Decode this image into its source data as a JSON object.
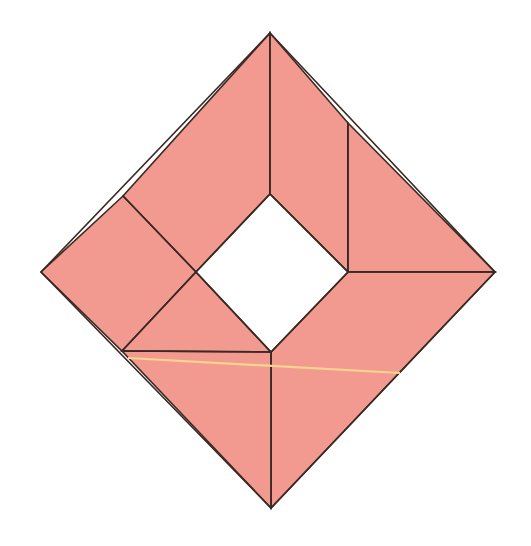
{
  "canvas": {
    "width": 531,
    "height": 546,
    "background_color": "#FFFFFF",
    "title": "Folded square diagram"
  },
  "style": {
    "fill_color": "#F29A90",
    "edge_color": "#3A2A24",
    "edge_width": 1.6,
    "crease_width": 1.4,
    "highlight_color": "#F8D58C",
    "highlight_width": 2.2,
    "hole_color": "#FFFFFF"
  },
  "geometry": {
    "outer_diamond": {
      "name": "outer-square-rotated-45",
      "vertices": {
        "top": [
          270,
          33
        ],
        "right": [
          495,
          272
        ],
        "bottom": [
          271,
          508
        ],
        "left": [
          41,
          272
        ]
      }
    },
    "inner_hole": {
      "name": "inner-white-square",
      "vertices": {
        "top": [
          270,
          194
        ],
        "right": [
          348,
          272
        ],
        "bottom": [
          271,
          352
        ],
        "left": [
          196,
          272
        ]
      }
    },
    "crease_points": {
      "upper_left_edge_branch": [
        123,
        196
      ],
      "upper_right_edge_branch": [
        348,
        123
      ],
      "lower_left_edge_branch": [
        122,
        351
      ],
      "highlight_start": [
        128,
        358
      ],
      "highlight_end": [
        400,
        373
      ]
    }
  },
  "shapes": [
    {
      "name": "face-top-left",
      "points": "270,33 270,194 196,272 123,196",
      "description": "Upper left flap of folded paper"
    },
    {
      "name": "face-left-outer",
      "points": "123,196 196,272 122,351 41,272",
      "description": "Left outer quadrant wedge"
    },
    {
      "name": "face-left-inner-triangle",
      "points": "196,272 271,352 122,351",
      "description": "Lower left inner triangle"
    },
    {
      "name": "face-top-right",
      "points": "270,33 348,123 348,272 270,194",
      "description": "Upper right flap of folded paper"
    },
    {
      "name": "face-right-outer",
      "points": "348,123 495,272 348,272",
      "description": "Right outer triangle"
    },
    {
      "name": "face-right-lower",
      "points": "348,272 495,272 271,508 271,352",
      "description": "Lower right large quadrilateral"
    },
    {
      "name": "face-bottom-left",
      "points": "122,351 271,352 271,508",
      "description": "Bottom left triangle"
    }
  ],
  "creases": [
    {
      "name": "crease-apex-to-hole-top",
      "from": [
        270,
        33
      ],
      "to": [
        270,
        194
      ]
    },
    {
      "name": "crease-hole-top-left-edge",
      "from": [
        270,
        194
      ],
      "to": [
        196,
        272
      ]
    },
    {
      "name": "crease-hole-top-right-edge",
      "from": [
        270,
        194
      ],
      "to": [
        348,
        272
      ]
    },
    {
      "name": "crease-hole-bottom-left-edge",
      "from": [
        196,
        272
      ],
      "to": [
        271,
        352
      ]
    },
    {
      "name": "crease-hole-bottom-right-edge",
      "from": [
        348,
        272
      ],
      "to": [
        271,
        352
      ]
    },
    {
      "name": "crease-upper-left-diagonal",
      "from": [
        123,
        196
      ],
      "to": [
        196,
        272
      ]
    },
    {
      "name": "crease-left-lower-diagonal",
      "from": [
        196,
        272
      ],
      "to": [
        122,
        351
      ]
    },
    {
      "name": "crease-lower-left-horizontal",
      "from": [
        122,
        351
      ],
      "to": [
        271,
        352
      ]
    },
    {
      "name": "crease-upper-right-vertical",
      "from": [
        348,
        123
      ],
      "to": [
        348,
        272
      ]
    },
    {
      "name": "crease-right-horizontal",
      "from": [
        348,
        272
      ],
      "to": [
        495,
        272
      ]
    },
    {
      "name": "crease-hole-bottom-to-apex",
      "from": [
        271,
        352
      ],
      "to": [
        271,
        508
      ]
    }
  ],
  "highlight": {
    "name": "highlight-fold-line",
    "color": "#F8D58C",
    "from": [
      128,
      358
    ],
    "to": [
      400,
      373
    ],
    "description": "Light yellow guide line across the lower portion"
  }
}
